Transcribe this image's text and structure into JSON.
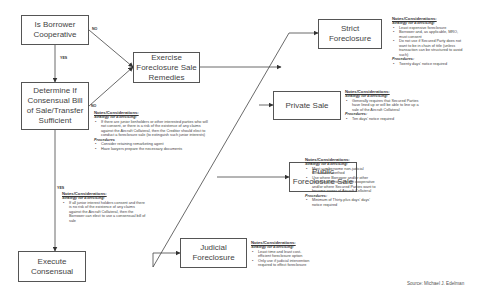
{
  "boxes": {
    "borrower_cooperative": "Is Borrower Cooperative",
    "determine_consensual": "Determine If Consensual Bill of Sale/Transfer Sufficient",
    "exercise_remedies": "Exercise Foreclosure Sale Remedies",
    "execute_consensual": "Execute Consensual",
    "strict_foreclosure": "Strict Foreclosure",
    "private_sale": "Private Sale",
    "public_sale": "Public Foreclosure Sale",
    "judicial_foreclosure": "Judicial Foreclosure"
  },
  "edge_labels": {
    "borrower_no": "NO",
    "borrower_yes": "YES",
    "determine_no": "NO",
    "determine_yes": "YES"
  },
  "notes": {
    "exercise": {
      "heading": "Notes/Considerations:",
      "strategy_label": "Strategy for Exercising:",
      "strategy": [
        "If there are junior lienholders or other interested parties who will not consent, or there is a risk of the existence of any claims against the Aircraft Collateral, then the Creditor should elect to conduct a foreclosure sale (to extinguish such junior interests)"
      ],
      "procedures_label": "Procedures",
      "procedures": [
        "Consider retaining remarketing agent",
        "Have lawyers prepare the necessary documents"
      ]
    },
    "consensual": {
      "heading": "Notes/Considerations:",
      "strategy_label": "Strategy for Exercising:",
      "strategy": [
        "If all junior interest holders consent and there is no risk of the existence of any claims against the Aircraft Collateral, then the Borrower can elect to use a consensual bill of sale"
      ]
    },
    "strict": {
      "heading": "Notes/Considerations:",
      "strategy_label": "Strategy for Exercising:",
      "strategy": [
        "Least expensive foreclosure",
        "Borrower and, as applicable, MRO, must consent",
        "Do not use if Secured Party does not want to be in chain of title (unless transaction can be structured to avoid such)"
      ],
      "procedures_label": "Procedures:",
      "procedures": [
        "Twenty days' notice required"
      ]
    },
    "private": {
      "heading": "Notes/Considerations:",
      "strategy_label": "Strategy for Exercising:",
      "strategy": [
        "Generally requires that Secured Parties have lined up or will be able to line up a sale of the Aircraft Collateral"
      ],
      "procedures_label": "Procedures:",
      "procedures": [
        "Ten days' notice required"
      ]
    },
    "public": {
      "heading": "Notes/Considerations:",
      "strategy_label": "Strategy for Exercising:",
      "strategy": [
        "Most cumbersome non-judicial foreclosure method",
        "Use where Borrower and/or other interested parties are not cooperative and/or where Secured Parties want to become owner of Aircraft Collateral"
      ],
      "procedures_label": "Procedures:",
      "procedures": [
        "Minimum of Thirty-plus days' days' notice required"
      ]
    },
    "judicial": {
      "heading": "Notes/Considerations:",
      "strategy_label": "Strategy for Exercising:",
      "strategy": [
        "Least time and least cost-efficient foreclosure option",
        "Only use if judicial intervention required to effect foreclosure"
      ]
    }
  },
  "source": "Source: Michael J. Edelman"
}
